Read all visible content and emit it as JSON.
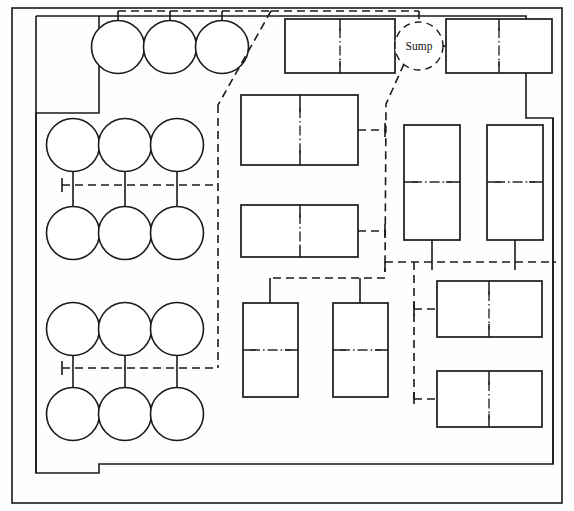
{
  "diagram": {
    "canvas": {
      "width": 574,
      "height": 511
    },
    "labels": {
      "sump": "Sump"
    },
    "colors": {
      "line": "#1a1a1a",
      "background": "#ffffff",
      "centerline": "#2a2a2a"
    },
    "walls": {
      "outer_frame": {
        "x": 12,
        "y": 8,
        "width": 550,
        "height": 495
      },
      "inner_room": {
        "x": 36,
        "y": 16,
        "width": 522,
        "height": 468
      },
      "left_notch": {
        "x": 36,
        "y": 113,
        "width": 0,
        "height": 360
      },
      "left_notch_label": "left-wall-recess",
      "right_notch_label": "right-wall-recess"
    },
    "tanks": {
      "label": "circular-tank",
      "radius": 26.5,
      "rows": [
        {
          "row": 1,
          "cy": 47,
          "cx": [
            118,
            170,
            222
          ]
        },
        {
          "row": 2,
          "cy": 145,
          "cx": [
            73,
            125,
            177
          ]
        },
        {
          "row": 3,
          "cy": 233,
          "cx": [
            73,
            125,
            177
          ]
        },
        {
          "row": 4,
          "cy": 329,
          "cx": [
            73,
            125,
            177
          ]
        },
        {
          "row": 5,
          "cy": 414,
          "cx": [
            73,
            125,
            177
          ]
        }
      ],
      "count": 15
    },
    "equipment": [
      {
        "id": "unit-a1",
        "name": "process-unit-top-left",
        "x": 285,
        "y": 19,
        "width": 110,
        "height": 54,
        "divider": "vertical"
      },
      {
        "id": "unit-a2",
        "name": "process-unit-top-right",
        "x": 446,
        "y": 19,
        "width": 106,
        "height": 54,
        "divider": "vertical"
      },
      {
        "id": "unit-b1",
        "name": "process-unit-mid-left-1",
        "x": 241,
        "y": 95,
        "width": 117,
        "height": 70,
        "divider": "vertical"
      },
      {
        "id": "unit-b2",
        "name": "process-unit-mid-left-2",
        "x": 241,
        "y": 205,
        "width": 117,
        "height": 52,
        "divider": "vertical"
      },
      {
        "id": "unit-c1",
        "name": "process-unit-right-col-1",
        "x": 404,
        "y": 125,
        "width": 56,
        "height": 115,
        "divider": "horizontal"
      },
      {
        "id": "unit-c2",
        "name": "process-unit-right-col-2",
        "x": 487,
        "y": 125,
        "width": 56,
        "height": 115,
        "divider": "horizontal"
      },
      {
        "id": "unit-d1",
        "name": "process-unit-lower-mid-1",
        "x": 243,
        "y": 303,
        "width": 55,
        "height": 94,
        "divider": "horizontal"
      },
      {
        "id": "unit-d2",
        "name": "process-unit-lower-mid-2",
        "x": 333,
        "y": 303,
        "width": 55,
        "height": 94,
        "divider": "horizontal"
      },
      {
        "id": "unit-e1",
        "name": "process-unit-lower-right-1",
        "x": 437,
        "y": 281,
        "width": 105,
        "height": 56,
        "divider": "vertical"
      },
      {
        "id": "unit-e2",
        "name": "process-unit-lower-right-2",
        "x": 437,
        "y": 371,
        "width": 105,
        "height": 56,
        "divider": "vertical"
      }
    ],
    "sump": {
      "cx": 419,
      "cy": 46,
      "r": 24
    },
    "piping": {
      "style": "dashed",
      "networks": [
        {
          "name": "top-tank-header",
          "path": "M118 11 L271 11"
        },
        {
          "name": "diagonal-main",
          "path": "M271 11 L218 105"
        },
        {
          "name": "left-vertical-trunk",
          "path": "M218 105 L218 368"
        },
        {
          "name": "tank-manifold-upper",
          "path": "M62 185 L218 185"
        },
        {
          "name": "tank-manifold-lower",
          "path": "M62 368 L218 368"
        },
        {
          "name": "sump-to-branch",
          "path": "M404 64 L385 105 L385 272"
        },
        {
          "name": "unit-b1-branch",
          "path": "M358 130 L385 130"
        },
        {
          "name": "unit-b2-branch",
          "path": "M358 231 L385 231"
        },
        {
          "name": "lower-mid-header",
          "path": "M385 278 L270 278"
        },
        {
          "name": "right-lower-manifold",
          "path": "M385 262 L556 262"
        },
        {
          "name": "right-branch-trunk",
          "path": "M414 262 L414 404"
        },
        {
          "name": "unit-e1-branch",
          "path": "M414 309 L437 309"
        },
        {
          "name": "unit-e2-branch",
          "path": "M414 399 L437 399"
        }
      ]
    }
  }
}
